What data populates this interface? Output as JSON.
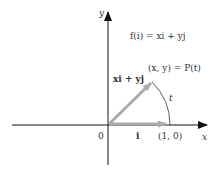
{
  "figure": {
    "equation_top": "f(i) = xi + yj",
    "point_label": "(x, y) = P(t)",
    "vector_label": "xi + yj",
    "arc_label": "t",
    "origin_label": "0",
    "unit_vector_label": "i",
    "unit_point_label": "(1, 0)",
    "x_axis_label": "x",
    "y_axis_label": "y"
  },
  "colors": {
    "axis": "#111111",
    "vector": "#aaaaaa",
    "text": "#333333"
  }
}
